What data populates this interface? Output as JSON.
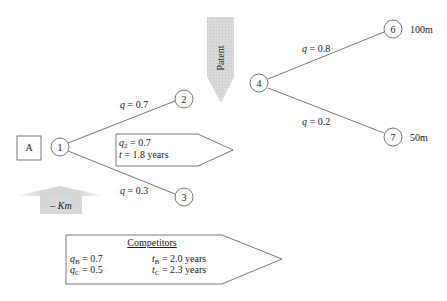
{
  "nodes": [
    {
      "id": "A",
      "label": "A",
      "type": "square"
    },
    {
      "id": "1",
      "label": "1",
      "type": "circle"
    },
    {
      "id": "2",
      "label": "2",
      "type": "circle"
    },
    {
      "id": "3",
      "label": "3",
      "type": "circle"
    },
    {
      "id": "4",
      "label": "4",
      "type": "circle"
    },
    {
      "id": "6",
      "label": "6",
      "type": "circle",
      "outcome": "100m"
    },
    {
      "id": "7",
      "label": "7",
      "type": "circle",
      "outcome": "50m"
    }
  ],
  "edges": [
    {
      "from": "1",
      "to": "2",
      "q_symbol": "q",
      "q_value": " = 0.7"
    },
    {
      "from": "1",
      "to": "3",
      "q_symbol": "q",
      "q_value": " = 0.3"
    },
    {
      "from": "4",
      "to": "6",
      "q_symbol": "q",
      "q_value": " = 0.8"
    },
    {
      "from": "4",
      "to": "7",
      "q_symbol": "q",
      "q_value": " = 0.2"
    }
  ],
  "patent_arrow": {
    "label": "Patent"
  },
  "cost_arrow": {
    "prefix": "– ",
    "symbol": "Km"
  },
  "stage_box": {
    "line1_symbol": "q",
    "line1_sub": "2",
    "line1_value": " = 0.7",
    "line2_symbol": "t",
    "line2_value": " = 1.8 years"
  },
  "competitors_box": {
    "title": "Competitors",
    "rows": [
      {
        "q_sub": "B",
        "q_value": " = 0.7",
        "t_sub": "B",
        "t_value": " = 2.0 years"
      },
      {
        "q_sub": "C",
        "q_value": " = 0.5",
        "t_sub": "C",
        "t_value": " = 2.3 years"
      }
    ]
  },
  "colors": {
    "line": "#555555",
    "arrow_fill": "#d4d4d4",
    "text": "#222222"
  }
}
